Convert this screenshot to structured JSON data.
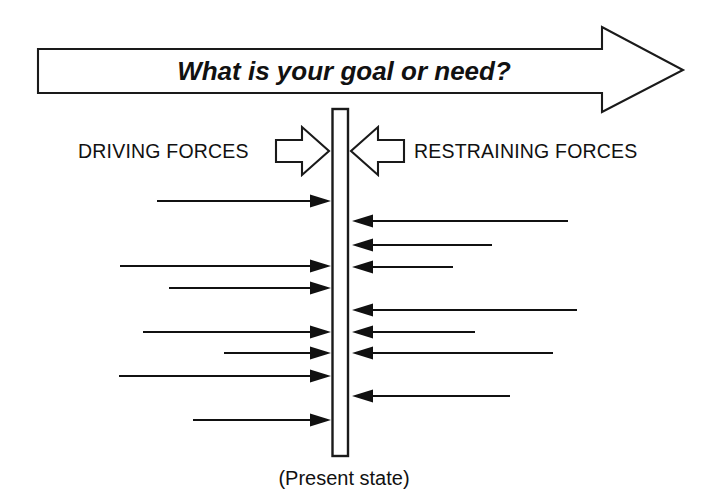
{
  "diagram": {
    "title_banner": {
      "text": "What is your goal or need?",
      "icon": "right-block-arrow"
    },
    "left_side": {
      "label": "DRIVING FORCES",
      "icon": "right-hollow-arrow"
    },
    "right_side": {
      "label": "RESTRAINING FORCES",
      "icon": "left-hollow-arrow"
    },
    "center": {
      "caption": "(Present state)",
      "bar_label": "present-state-bar"
    },
    "colors": {
      "ink": "#111111",
      "background": "#ffffff"
    },
    "driving_arrows": [
      {
        "y": 201,
        "start_x": 157,
        "tip_x": 331
      },
      {
        "y": 266,
        "start_x": 120,
        "tip_x": 331
      },
      {
        "y": 288,
        "start_x": 169,
        "tip_x": 331
      },
      {
        "y": 332,
        "start_x": 143,
        "tip_x": 331
      },
      {
        "y": 353,
        "start_x": 224,
        "tip_x": 331
      },
      {
        "y": 376,
        "start_x": 119,
        "tip_x": 331
      },
      {
        "y": 420,
        "start_x": 193,
        "tip_x": 331
      }
    ],
    "restraining_arrows": [
      {
        "y": 221,
        "start_x": 568,
        "tip_x": 352
      },
      {
        "y": 245,
        "start_x": 492,
        "tip_x": 352
      },
      {
        "y": 267,
        "start_x": 453,
        "tip_x": 352
      },
      {
        "y": 310,
        "start_x": 577,
        "tip_x": 352
      },
      {
        "y": 332,
        "start_x": 475,
        "tip_x": 352
      },
      {
        "y": 353,
        "start_x": 553,
        "tip_x": 352
      },
      {
        "y": 396,
        "start_x": 510,
        "tip_x": 352
      }
    ]
  },
  "chart_data": {
    "type": "diagram",
    "title": "What is your goal or need?",
    "subtype": "force-field-analysis",
    "categories": [
      "DRIVING FORCES",
      "RESTRAINING FORCES"
    ],
    "series": [
      {
        "name": "DRIVING FORCES",
        "direction": "right",
        "count": 7,
        "lengths": [
          174,
          211,
          162,
          188,
          107,
          212,
          138
        ]
      },
      {
        "name": "RESTRAINING FORCES",
        "direction": "left",
        "count": 7,
        "lengths": [
          216,
          140,
          101,
          225,
          123,
          201,
          158
        ]
      }
    ],
    "annotations": [
      "(Present state)"
    ],
    "xlabel": "",
    "ylabel": "",
    "grid": false,
    "legend": "none"
  }
}
